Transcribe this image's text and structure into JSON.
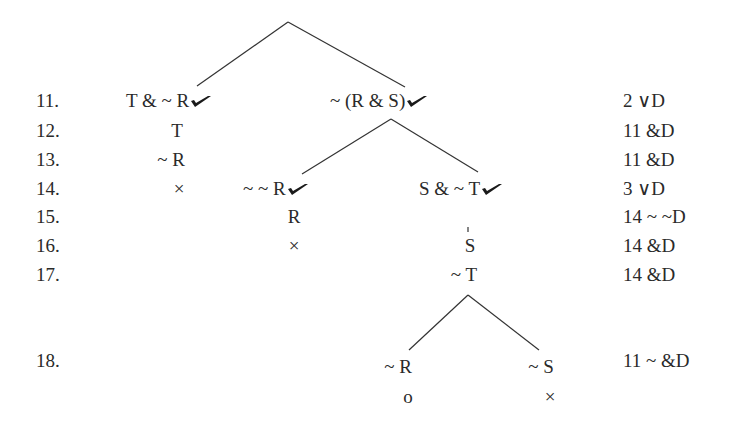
{
  "tree": {
    "rows": [
      {
        "line": "11.",
        "justification": "2 ∨D"
      },
      {
        "line": "12.",
        "justification": "11 &D"
      },
      {
        "line": "13.",
        "justification": "11 &D"
      },
      {
        "line": "14.",
        "justification": "3 ∨D"
      },
      {
        "line": "15.",
        "justification": "14 ~ ~D"
      },
      {
        "line": "16.",
        "justification": "14 &D"
      },
      {
        "line": "17.",
        "justification": "14 &D"
      },
      {
        "line": "18.",
        "justification": "11 ~ &D"
      }
    ],
    "nodes": {
      "left_11": "T & ~ R",
      "left_12": "T",
      "left_13": "~ R",
      "left_14_close": "×",
      "right_11": "~ (R & S)",
      "mid_14": "~ ~ R",
      "mid_15": "R",
      "mid_16_close": "×",
      "right_14": "S & ~ T",
      "right_16": "S",
      "right_17": "~ T",
      "branch_a_18": "~ R",
      "branch_a_open": "o",
      "branch_b_18": "~ S",
      "branch_b_close": "×"
    },
    "check_mark_icon": "checkmark-icon",
    "line_color": "#333333"
  }
}
